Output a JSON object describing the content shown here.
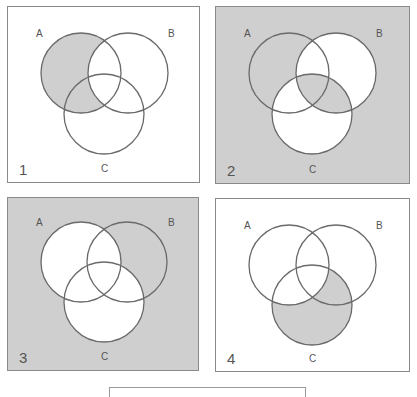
{
  "colors": {
    "shade": "#cfcfcf",
    "white": "#ffffff",
    "stroke": "#6a6a6a"
  },
  "panels": [
    {
      "number": "1",
      "labels": {
        "a": "A",
        "b": "B",
        "c": "C"
      },
      "background": "white",
      "shaded_regions": [
        "A-only",
        "A∩C−B"
      ],
      "expression": "A − B"
    },
    {
      "number": "2",
      "labels": {
        "a": "A",
        "b": "B",
        "c": "C"
      },
      "background": "shaded",
      "shaded_regions": [
        "outside",
        "A-only",
        "A∩B∩C",
        "B∩C−A"
      ],
      "white_regions": [
        "B-only",
        "C-only",
        "A∩B−C",
        "A∩C−B"
      ]
    },
    {
      "number": "3",
      "labels": {
        "a": "A",
        "b": "B",
        "c": "C"
      },
      "background": "shaded",
      "shaded_regions": [
        "outside",
        "B-only"
      ],
      "white_regions": [
        "A ∪ C"
      ]
    },
    {
      "number": "4",
      "labels": {
        "a": "A",
        "b": "B",
        "c": "C"
      },
      "background": "white",
      "shaded_regions": [
        "C-only",
        "B∩C−A"
      ],
      "expression": "C − A"
    }
  ]
}
